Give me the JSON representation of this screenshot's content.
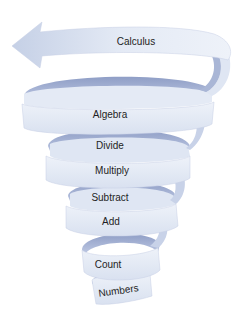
{
  "diagram": {
    "type": "spiral",
    "direction": "bottom-to-top",
    "colors": {
      "band_front": "#e6ecf6",
      "band_back": "#9aa8cc",
      "band_edge": "#b8c4e0",
      "text": "#1e1e24"
    },
    "labels": [
      {
        "id": "numbers",
        "text": "Numbers"
      },
      {
        "id": "count",
        "text": "Count"
      },
      {
        "id": "add",
        "text": "Add"
      },
      {
        "id": "subtract",
        "text": "Subtract"
      },
      {
        "id": "multiply",
        "text": "Multiply"
      },
      {
        "id": "divide",
        "text": "Divide"
      },
      {
        "id": "algebra",
        "text": "Algebra"
      },
      {
        "id": "calculus",
        "text": "Calculus"
      }
    ]
  }
}
